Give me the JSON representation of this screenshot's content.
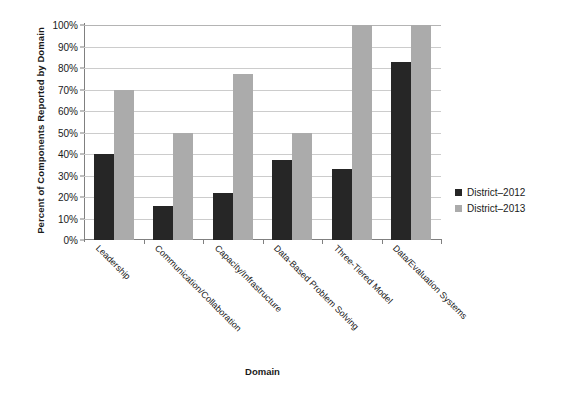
{
  "chart_data": {
    "type": "bar",
    "title": "",
    "xlabel": "Domain",
    "ylabel": "Percent of Components Reported by Domain",
    "categories": [
      "Leadership",
      "Communication/Collaboration",
      "Capacity/Infrastructure",
      "Data-Based Problem Solving",
      "Three-Tiered Model",
      "Data/Evaluation Systems"
    ],
    "series": [
      {
        "name": "District–2012",
        "color": "#262626",
        "values": [
          40,
          16,
          22,
          37,
          33,
          83
        ]
      },
      {
        "name": "District–2013",
        "color": "#ababab",
        "values": [
          70,
          50,
          77,
          50,
          100,
          100
        ]
      }
    ],
    "ylim": [
      0,
      100
    ],
    "ytick_values": [
      0,
      10,
      20,
      30,
      40,
      50,
      60,
      70,
      80,
      90,
      100
    ],
    "ytick_labels": [
      "0%",
      "10%",
      "20%",
      "30%",
      "40%",
      "50%",
      "60%",
      "70%",
      "80%",
      "90%",
      "100%"
    ],
    "grid": "horizontal",
    "legend_position": "right",
    "xtick_label_rotation": 45
  }
}
